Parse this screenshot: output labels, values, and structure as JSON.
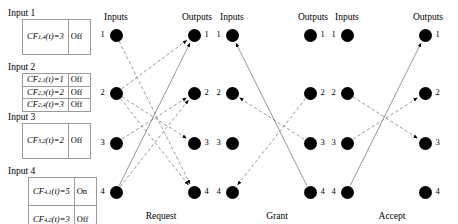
{
  "inputs": [
    {
      "title": "Input 1",
      "rows": [
        {
          "expr_main": "CF",
          "sub": "1,4",
          "var": "(t)",
          "eq": "=3",
          "state": "Off"
        }
      ]
    },
    {
      "title": "Input 2",
      "rows": [
        {
          "expr_main": "CF",
          "sub": "2,1",
          "var": "(t)",
          "eq": "=1",
          "state": "Off"
        },
        {
          "expr_main": "CF",
          "sub": "2,3",
          "var": "(t)",
          "eq": "=2",
          "state": "Off"
        },
        {
          "expr_main": "CF",
          "sub": "2,4",
          "var": "(t)",
          "eq": "=3",
          "state": "Off"
        }
      ]
    },
    {
      "title": "Input 3",
      "rows": [
        {
          "expr_main": "CF",
          "sub": "3,2",
          "var": "(t)",
          "eq": "=2",
          "state": "Off"
        }
      ]
    },
    {
      "title": "Input 4",
      "rows": [
        {
          "expr_main": "CF",
          "sub": "4,1",
          "var": "(t)",
          "eq": "=5",
          "state": "On"
        },
        {
          "expr_main": "CF",
          "sub": "4,2",
          "var": "(t)",
          "eq": "=3",
          "state": "Off"
        }
      ]
    }
  ],
  "panels": [
    {
      "caption": "Request",
      "inputs_label": "Inputs",
      "outputs_label": "Outputs",
      "node_labels": [
        "1",
        "2",
        "3",
        "4"
      ],
      "edges": [
        {
          "from": 1,
          "to": 4,
          "style": "dashed"
        },
        {
          "from": 2,
          "to": 1,
          "style": "dashed"
        },
        {
          "from": 2,
          "to": 3,
          "style": "dashed"
        },
        {
          "from": 2,
          "to": 4,
          "style": "dashed"
        },
        {
          "from": 3,
          "to": 2,
          "style": "dashed"
        },
        {
          "from": 4,
          "to": 1,
          "style": "solid"
        },
        {
          "from": 4,
          "to": 2,
          "style": "dashed"
        }
      ]
    },
    {
      "caption": "Grant",
      "inputs_label": "Inputs",
      "outputs_label": "Outputs",
      "node_labels": [
        "1",
        "2",
        "3",
        "4"
      ],
      "edges": [
        {
          "from": 2,
          "to": 3,
          "style": "dashed",
          "reverse": true
        },
        {
          "from": 4,
          "to": 2,
          "style": "dashed",
          "reverse": true
        },
        {
          "from": 1,
          "to": 4,
          "style": "solid",
          "reverse": true
        }
      ]
    },
    {
      "caption": "Accept",
      "inputs_label": "Inputs",
      "outputs_label": "Outputs",
      "node_labels": [
        "1",
        "2",
        "3",
        "4"
      ],
      "edges": [
        {
          "from": 2,
          "to": 3,
          "style": "dashed"
        },
        {
          "from": 3,
          "to": 2,
          "style": "dashed"
        },
        {
          "from": 4,
          "to": 1,
          "style": "solid"
        }
      ]
    }
  ],
  "colors": {
    "node": "#000000",
    "edge_dashed": "#8c8c8c",
    "edge_solid": "#8c8c8c",
    "box_border": "#9b9b9b",
    "background": "#ffffff"
  }
}
